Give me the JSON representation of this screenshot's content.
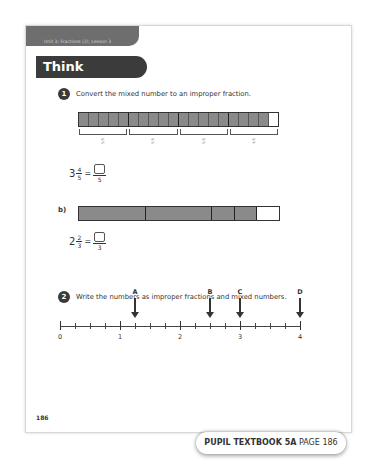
{
  "header": {
    "unit_label": "Unit 3: Fractions (2), Lesson 3",
    "section_title": "Think together"
  },
  "question1": {
    "number": "1",
    "prompt": "Convert the mixed number to an improper fraction.",
    "part_a": {
      "bar_cells": 20,
      "group_size": 5,
      "shaded_cells": 19,
      "brace_labels": [
        "5/5",
        "5/5",
        "5/5",
        "4/5"
      ],
      "equation": {
        "whole": "3",
        "numerator": "4",
        "denominator": "5",
        "answer_denominator": "5"
      }
    },
    "part_b": {
      "label": "b)",
      "segments": [
        {
          "width_thirds": 3,
          "shaded": true
        },
        {
          "width_thirds": 3,
          "shaded": true
        },
        {
          "width_thirds": 1,
          "shaded": true
        },
        {
          "width_thirds": 1,
          "shaded": true
        },
        {
          "width_thirds": 1,
          "shaded": false
        }
      ],
      "equation": {
        "whole": "2",
        "numerator": "2",
        "denominator": "3",
        "answer_denominator": "3"
      }
    }
  },
  "question2": {
    "number": "2",
    "prompt": "Write the numbers as improper fractions and mixed numbers.",
    "number_line": {
      "min": 0,
      "max": 4,
      "subdivisions_per_unit": 4,
      "major_labels": [
        "0",
        "1",
        "2",
        "3",
        "4"
      ],
      "markers": [
        {
          "label": "A",
          "value": 1.25
        },
        {
          "label": "B",
          "value": 2.5
        },
        {
          "label": "C",
          "value": 3
        },
        {
          "label": "D",
          "value": 4
        }
      ]
    }
  },
  "footer": {
    "page_number": "186",
    "badge_bold": "PUPIL TEXTBOOK 5A",
    "badge_regular": "PAGE 186"
  }
}
